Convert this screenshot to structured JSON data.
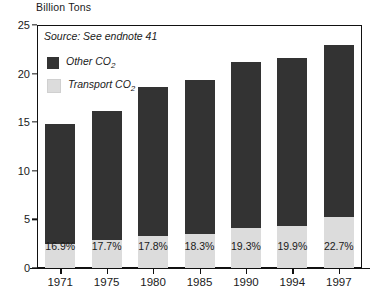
{
  "chart_data": {
    "type": "bar",
    "title": "Billion Tons",
    "subtitle": "Source: See endnote 41",
    "xlabel": "",
    "ylabel": "Billion Tons",
    "ylim": [
      0,
      25
    ],
    "yticks": [
      0,
      5,
      10,
      15,
      20,
      25
    ],
    "grid": false,
    "legend_position": "top-left",
    "stacked": true,
    "categories": [
      "1971",
      "1975",
      "1980",
      "1985",
      "1990",
      "1994",
      "1997"
    ],
    "series": [
      {
        "name": "Other CO2",
        "color": "#333333",
        "values": [
          12.3,
          13.3,
          15.3,
          15.8,
          17.1,
          17.3,
          17.7
        ]
      },
      {
        "name": "Transport CO2",
        "color": "#dcdcdc",
        "values": [
          2.5,
          2.9,
          3.3,
          3.5,
          4.1,
          4.3,
          5.2
        ]
      }
    ],
    "totals": [
      14.8,
      16.2,
      18.6,
      19.3,
      21.2,
      21.6,
      22.9
    ],
    "data_labels": [
      "16.9%",
      "17.7%",
      "17.8%",
      "18.3%",
      "19.3%",
      "19.9%",
      "22.7%"
    ],
    "data_label_note": "Transport share of total CO2"
  },
  "legend": {
    "items": [
      {
        "label_main": "Other CO",
        "label_sub": "2",
        "color": "#333333",
        "name": "other-co2"
      },
      {
        "label_main": "Transport  CO",
        "label_sub": "2",
        "color": "#dcdcdc",
        "name": "transport-co2"
      }
    ]
  },
  "colors": {
    "other_co2": "#333333",
    "transport_co2": "#dcdcdc",
    "axis": "#111111",
    "text": "#1a1a1a",
    "background": "#ffffff"
  }
}
